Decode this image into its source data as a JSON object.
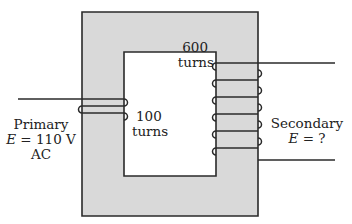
{
  "diagram": {
    "type": "transformer",
    "core_color": "#d9d9d9",
    "line_color": "#2a2a2a",
    "primary": {
      "label": "Primary",
      "voltage_symbol": "E",
      "voltage_value": "= 110 V",
      "current_type": "AC",
      "turns_value": "100",
      "turns_unit": "turns"
    },
    "secondary": {
      "label": "Secondary",
      "voltage_symbol": "E",
      "voltage_value": "= ?",
      "turns_value": "600",
      "turns_unit": "turns"
    }
  }
}
